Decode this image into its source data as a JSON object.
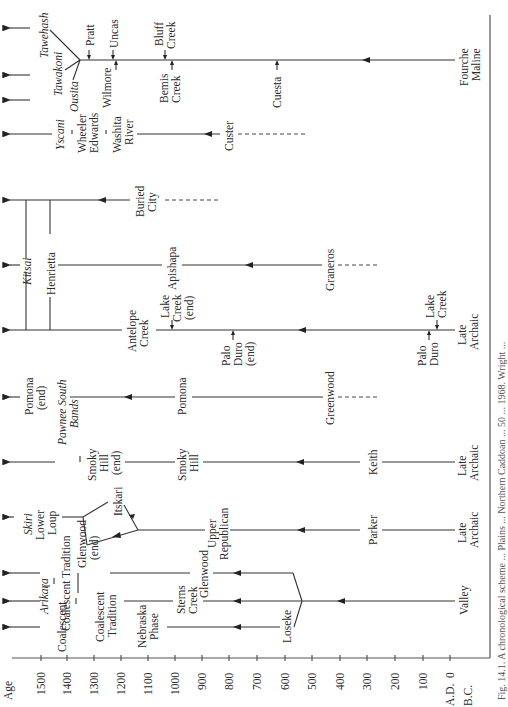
{
  "figure": {
    "orientation": "rotated-90-ccw",
    "axis": {
      "label": "Age",
      "ticks": [
        "1500",
        "1400",
        "1300",
        "1200",
        "1100",
        "1000",
        "900",
        "800",
        "700",
        "600",
        "500",
        "400",
        "300",
        "200",
        "100",
        "0"
      ],
      "era_ad": "A.D.",
      "era_bc": "B.C."
    },
    "caption_fragments": "Fig. 14.1. A chronological scheme ... Plains ... Northern Caddoan ... 50 ... 1968. Wright ...",
    "sequences": {
      "wichita": {
        "historic": [
          "Tawehash",
          "Tawakoni",
          "Ousita"
        ],
        "phases": [
          "Pratt",
          "Uncas",
          "Wilmore",
          "Bluff Creek",
          "Bemis Creek",
          "Cuesta",
          "Fourche Maline"
        ]
      },
      "washita": {
        "historic": "Yscani",
        "phases": [
          "Wheeler",
          "Edwards",
          "Washita River",
          "Custer"
        ]
      },
      "panhandle": {
        "historic": "Kitsai",
        "phases": [
          "Henrietta",
          "Buried City",
          "Apishapa",
          "Graneros",
          "Antelope Creek",
          "Lake Creek (end)",
          "Palo Duro (end)",
          "Lake Creek",
          "Palo Duro",
          "Late Archaic"
        ]
      },
      "pomona": {
        "historic": "Pawnee South Bands",
        "phases": [
          "Pomona (end)",
          "Pomona",
          "Greenwood"
        ]
      },
      "smoky_hill": {
        "phases": [
          "Smoky Hill (end)",
          "Smoky Hill",
          "Keith",
          "Late Archaic"
        ]
      },
      "republican": {
        "historic": "Skiri",
        "phases": [
          "Lower Loup",
          "Itskari",
          "Upper Republican",
          "Parker",
          "Late Archaic"
        ]
      },
      "missouri": {
        "historic": "Arikara",
        "phases": [
          "Coalescent Tradition",
          "Glenwood (end)",
          "Coalescent Tradition",
          "Nebraska Phase",
          "Sterns Creek",
          "Glenwood",
          "Loseke",
          "Valley"
        ]
      }
    }
  },
  "labels": {
    "tawehash": "Tawehash",
    "tawakoni": "Tawakoni",
    "ousita": "Ousita",
    "pratt": "Pratt",
    "uncas": "Uncas",
    "wilmore": "Wilmore",
    "bluff": "Bluff",
    "creek": "Creek",
    "bemis": "Bemis",
    "cuesta": "Cuesta",
    "fourche": "Fourche",
    "maline": "Maline",
    "yscani": "Yscani",
    "wheeler": "Wheeler",
    "edwards": "Edwards",
    "washita": "Washita",
    "river": "River",
    "custer": "Custer",
    "kitsai": "Kitsai",
    "henrietta": "Henrietta",
    "buried": "Buried",
    "city": "City",
    "apishapa": "Apishapa",
    "graneros": "Graneros",
    "antelope": "Antelope",
    "lake": "Lake",
    "end": "(end)",
    "palo": "Palo",
    "duro": "Duro",
    "late": "Late",
    "archaic": "Archaic",
    "pomona": "Pomona",
    "pawnee_south": "Pawnee South",
    "bands": "Bands",
    "greenwood": "Greenwood",
    "smoky": "Smoky",
    "hill": "Hill",
    "keith": "Keith",
    "skiri": "Skiri",
    "lower": "Lower",
    "loup": "Loup",
    "itskari": "Itskari",
    "upper": "Upper",
    "republican": "Republican",
    "parker": "Parker",
    "arikara": "Arikara",
    "coalescent_tradition": "Coalescent Tradition",
    "coalescent": "Coalescent",
    "tradition": "Tradition",
    "glenwood": "Glenwood",
    "nebraska": "Nebraska",
    "phase": "Phase",
    "sterns": "Sterns",
    "loseke": "Loseke",
    "valley": "Valley"
  }
}
